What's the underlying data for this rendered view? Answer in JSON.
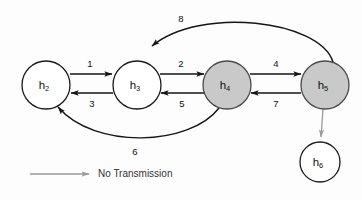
{
  "diagram": {
    "background_color": "#fdfdfd",
    "node_fill_active": "#c9c9c9",
    "node_fill_inactive": "#ffffff",
    "edge_color": "#151515",
    "no_transmission_color": "#9a9a9a"
  },
  "nodes": [
    {
      "id": "h2",
      "base": "h",
      "sub": "2",
      "cx": 46,
      "cy": 85,
      "r": 24,
      "filled": false
    },
    {
      "id": "h3",
      "base": "h",
      "sub": "3",
      "cx": 137,
      "cy": 85,
      "r": 24,
      "filled": false
    },
    {
      "id": "h4",
      "base": "h",
      "sub": "4",
      "cx": 227,
      "cy": 85,
      "r": 24,
      "filled": true
    },
    {
      "id": "h5",
      "base": "h",
      "sub": "5",
      "cx": 325,
      "cy": 85,
      "r": 24,
      "filled": true
    },
    {
      "id": "h6",
      "base": "h",
      "sub": "6",
      "cx": 320,
      "cy": 162,
      "r": 20,
      "filled": false
    }
  ],
  "edges": [
    {
      "label": "1",
      "from": "h2",
      "to": "h3",
      "shape": "straight",
      "transmitting": true
    },
    {
      "label": "3",
      "from": "h3",
      "to": "h2",
      "shape": "straight",
      "transmitting": true
    },
    {
      "label": "2",
      "from": "h3",
      "to": "h4",
      "shape": "straight",
      "transmitting": true
    },
    {
      "label": "5",
      "from": "h4",
      "to": "h3",
      "shape": "straight",
      "transmitting": true
    },
    {
      "label": "4",
      "from": "h4",
      "to": "h5",
      "shape": "straight",
      "transmitting": true
    },
    {
      "label": "7",
      "from": "h5",
      "to": "h4",
      "shape": "straight",
      "transmitting": true
    },
    {
      "label": "8",
      "from": "h5",
      "to": "h3",
      "shape": "curve-top",
      "transmitting": true
    },
    {
      "label": "6",
      "from": "h4",
      "to": "h2",
      "shape": "curve-bottom",
      "transmitting": true
    },
    {
      "label": "",
      "from": "h5",
      "to": "h6",
      "shape": "straight",
      "transmitting": false
    }
  ],
  "edge_labels": {
    "e1": "1",
    "e2": "2",
    "e3": "3",
    "e4": "4",
    "e5": "5",
    "e6": "6",
    "e7": "7",
    "e8": "8"
  },
  "node_labels": {
    "h2_base": "h",
    "h2_sub": "2",
    "h3_base": "h",
    "h3_sub": "3",
    "h4_base": "h",
    "h4_sub": "4",
    "h5_base": "h",
    "h5_sub": "5",
    "h6_base": "h",
    "h6_sub": "6"
  },
  "legend": {
    "text": "No Transmission",
    "arrow_color": "#9a9a9a",
    "icon": "arrow-right-icon"
  }
}
